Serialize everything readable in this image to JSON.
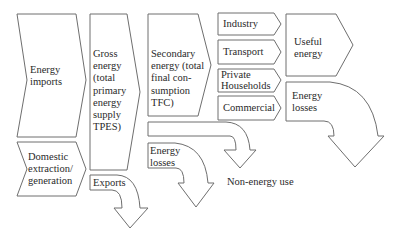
{
  "diagram": {
    "colors": {
      "stroke": "#6e6e6e",
      "fill": "#ffffff",
      "text": "#2a2a2a"
    },
    "energy_imports": {
      "lines": [
        "Energy",
        "imports"
      ]
    },
    "domestic": {
      "lines": [
        "Domestic",
        "extraction/",
        "generation"
      ]
    },
    "gross_energy": {
      "lines": [
        "Gross",
        "energy",
        "(total",
        "primary",
        "energy",
        "supply",
        "TPES)"
      ]
    },
    "exports": {
      "label": "Exports"
    },
    "secondary_energy": {
      "lines": [
        "Secondary",
        "energy (total",
        "final con-",
        "sumption",
        "TFC)"
      ]
    },
    "secondary_losses": {
      "lines": [
        "Energy",
        "losses"
      ]
    },
    "non_energy_use": {
      "label": "Non-energy use"
    },
    "sectors": [
      {
        "lines": [
          "Industry"
        ]
      },
      {
        "lines": [
          "Transport"
        ]
      },
      {
        "lines": [
          "Private",
          "Households"
        ]
      },
      {
        "lines": [
          "Commercial"
        ]
      }
    ],
    "useful_energy": {
      "lines": [
        "Useful",
        "energy"
      ]
    },
    "final_losses": {
      "lines": [
        "Energy",
        "losses"
      ]
    }
  }
}
